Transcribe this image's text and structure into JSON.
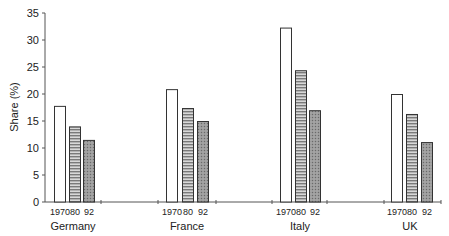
{
  "chart_data": {
    "type": "bar",
    "title": "",
    "xlabel": "",
    "ylabel": "Share (%)",
    "ylim": [
      0,
      35
    ],
    "yticks": [
      0,
      5,
      10,
      15,
      20,
      25,
      30,
      35
    ],
    "grid": false,
    "legend": null,
    "groups": [
      "Germany",
      "France",
      "Italy",
      "UK"
    ],
    "bar_labels": [
      "1970",
      "80",
      "92"
    ],
    "series": [
      {
        "name": "1970",
        "fill": "white",
        "values": [
          17.8,
          20.9,
          32.3,
          20.0
        ]
      },
      {
        "name": "80",
        "fill": "horizontal-stripes",
        "values": [
          14.0,
          17.4,
          24.4,
          16.3
        ]
      },
      {
        "name": "92",
        "fill": "stippled-gray",
        "values": [
          11.5,
          15.0,
          17.0,
          11.1
        ]
      }
    ]
  },
  "layout": {
    "plot": {
      "x0": 45,
      "y0": 202,
      "px_per_unit": 5.4
    },
    "group_bar_x": [
      [
        54,
        69,
        83
      ],
      [
        166,
        182,
        197
      ],
      [
        280,
        295,
        309
      ],
      [
        391,
        406,
        421
      ]
    ],
    "bar_width": 11,
    "group_label_x": [
      73,
      187,
      300,
      410
    ],
    "axis_ticks_x": [
      101,
      158,
      216,
      272,
      327,
      384,
      441
    ],
    "axis_end_x": 441
  },
  "colors": {
    "outline": "#333333",
    "stripe_dark": "#7a7a7a",
    "stripe_light": "#d8d8d8",
    "stipple": "#8a8a8a",
    "axis": "#555555"
  }
}
